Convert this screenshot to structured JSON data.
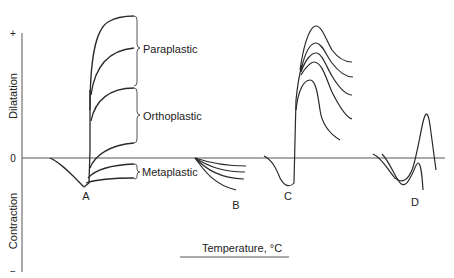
{
  "figure": {
    "y_axis": {
      "top_tick": "+",
      "zero_tick": "0",
      "bottom_tick": "−",
      "upper_label": "Dilatation",
      "lower_label": "Contraction"
    },
    "x_axis": {
      "label": "Temperature, °C"
    },
    "curve_labels": {
      "a": "A",
      "b": "B",
      "c": "C",
      "d": "D"
    },
    "group_labels": {
      "paraplastic": "Paraplastic",
      "orthoplastic": "Orthoplastic",
      "metaplastic": "Metaplastic"
    },
    "colors": {
      "line": "#2a2a2a",
      "axis": "#555555",
      "background": "#ffffff"
    }
  }
}
